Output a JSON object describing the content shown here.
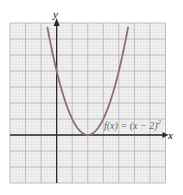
{
  "chart_data": {
    "type": "line",
    "title": "",
    "xlabel": "x",
    "ylabel": "y",
    "function_label": "f(x) = (x − 2)²",
    "function_label_base": "f(x) = (x − 2)",
    "function_label_exp": "2",
    "xlim": [
      -3,
      7
    ],
    "ylim": [
      -3,
      7
    ],
    "grid": true,
    "minor_grid": true,
    "tick_labels": false,
    "series": [
      {
        "name": "f(x) = (x − 2)²",
        "x": [
          -0.6,
          0,
          0.5,
          1,
          1.5,
          2,
          2.5,
          3,
          3.5,
          4,
          4.6
        ],
        "values": [
          6.76,
          4,
          2.25,
          1,
          0.25,
          0,
          0.25,
          1,
          2.25,
          4,
          6.76
        ]
      }
    ],
    "vertex": [
      2,
      0
    ],
    "y_intercept": [
      0,
      4
    ]
  },
  "colors": {
    "curve": "#8c6e72",
    "axis": "#2a2a2a",
    "grid_major": "#b4b4b4",
    "grid_minor": "#dcdcdc",
    "grid_bg": "#f2f2f2"
  }
}
